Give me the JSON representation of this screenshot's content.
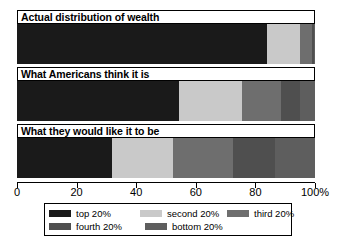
{
  "chart_data": {
    "type": "bar",
    "orientation": "horizontal",
    "stacked": true,
    "title": "",
    "xlabel": "",
    "ylabel": "",
    "xlim": [
      0,
      100
    ],
    "xticks": [
      0,
      20,
      40,
      60,
      80,
      100
    ],
    "xticklabels": [
      "0",
      "20",
      "40",
      "60",
      "80",
      "100%"
    ],
    "grid": false,
    "legend_position": "bottom",
    "categories": [
      "Actual distribution of wealth",
      "What Americans think it is",
      "What they would like it to be"
    ],
    "series": [
      {
        "name": "top 20%",
        "color": "#1a1a1a",
        "values": [
          84.0,
          54.5,
          32.0
        ]
      },
      {
        "name": "second 20%",
        "color": "#c9c9c9",
        "values": [
          11.0,
          21.0,
          20.5
        ]
      },
      {
        "name": "third 20%",
        "color": "#6e6e6e",
        "values": [
          4.0,
          13.0,
          20.0
        ]
      },
      {
        "name": "fourth 20%",
        "color": "#4f4f4f",
        "values": [
          0.6,
          6.5,
          14.0
        ]
      },
      {
        "name": "bottom 20%",
        "color": "#5e5e5e",
        "values": [
          0.4,
          5.0,
          13.5
        ]
      }
    ]
  },
  "axis": {
    "tick_labels": [
      "0",
      "20",
      "40",
      "60",
      "80",
      "100%"
    ],
    "tick_values": [
      0,
      20,
      40,
      60,
      80,
      100
    ]
  },
  "legend": {
    "rows": [
      [
        {
          "label": "top 20%",
          "color": "#1a1a1a"
        },
        {
          "label": "second 20%",
          "color": "#c9c9c9"
        },
        {
          "label": "third 20%",
          "color": "#6e6e6e"
        }
      ],
      [
        {
          "label": "fourth 20%",
          "color": "#4f4f4f"
        },
        {
          "label": "bottom 20%",
          "color": "#5e5e5e"
        }
      ]
    ]
  }
}
